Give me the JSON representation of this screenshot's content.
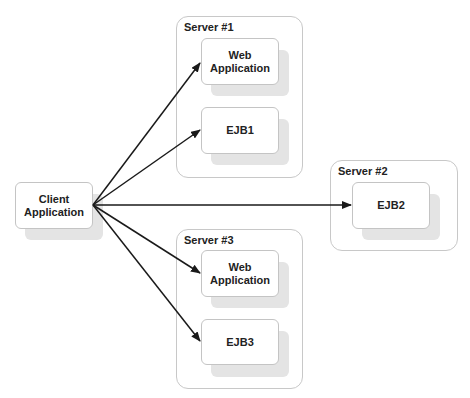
{
  "client": {
    "label": "Client\nApplication"
  },
  "servers": [
    {
      "title": "Server #1",
      "components": [
        {
          "label": "Web\nApplication"
        },
        {
          "label": "EJB1"
        }
      ]
    },
    {
      "title": "Server #2",
      "components": [
        {
          "label": "EJB2"
        }
      ]
    },
    {
      "title": "Server #3",
      "components": [
        {
          "label": "Web\nApplication"
        },
        {
          "label": "EJB3"
        }
      ]
    }
  ],
  "connections": [
    {
      "from": "Client Application",
      "to": "Server #1 / Web Application"
    },
    {
      "from": "Client Application",
      "to": "Server #1 / EJB1"
    },
    {
      "from": "Client Application",
      "to": "Server #2 / EJB2"
    },
    {
      "from": "Client Application",
      "to": "Server #3 / Web Application"
    },
    {
      "from": "Client Application",
      "to": "Server #3 / EJB3"
    }
  ],
  "colors": {
    "arrow": "#1a1a1a",
    "border": "#c4c4c4",
    "shadow": "#e4e4e4"
  }
}
